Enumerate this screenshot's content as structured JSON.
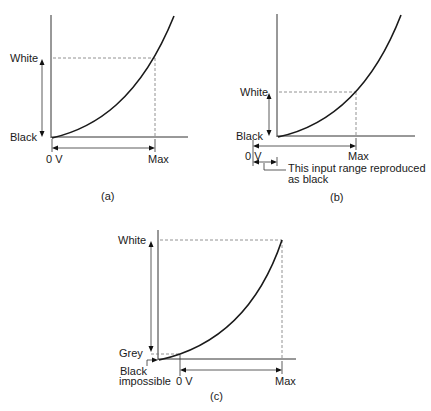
{
  "figure": {
    "panels": [
      {
        "id": "a",
        "caption": "(a)",
        "labels": {
          "white": "White",
          "black": "Black",
          "zero": "0 V",
          "max": "Max"
        }
      },
      {
        "id": "b",
        "caption": "(b)",
        "labels": {
          "white": "White",
          "black": "Black",
          "zero": "0 V",
          "max": "Max",
          "note_line1": "This input range reproduced",
          "note_line2": "as black"
        }
      },
      {
        "id": "c",
        "caption": "(c)",
        "labels": {
          "white": "White",
          "grey": "Grey",
          "black_line1": "Black",
          "black_line2": "impossible",
          "zero": "0 V",
          "max": "Max"
        }
      }
    ]
  },
  "colors": {
    "line": "#1a1a1a",
    "dash": "#777777",
    "background": "#ffffff"
  }
}
